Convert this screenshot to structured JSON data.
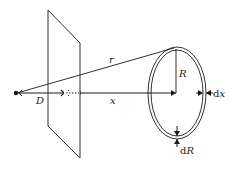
{
  "diagram": {
    "labels": {
      "D": "D",
      "x": "x",
      "r": "r",
      "R": "R",
      "dx_d": "d",
      "dx_var": "x",
      "dR_d": "d",
      "dR_var": "R"
    },
    "colors": {
      "stroke": "#1a1a1a",
      "background": "#ffffff"
    },
    "elements": [
      {
        "name": "point-source",
        "shape": "dot"
      },
      {
        "name": "plane",
        "shape": "parallelogram"
      },
      {
        "name": "axis-line",
        "shape": "arrow",
        "label": "x"
      },
      {
        "name": "distance-D",
        "shape": "dimension",
        "label": "D"
      },
      {
        "name": "slant-line",
        "shape": "line",
        "label": "r"
      },
      {
        "name": "ring",
        "shape": "double-ellipse",
        "label": "R"
      },
      {
        "name": "thickness-dx",
        "shape": "dimension",
        "label": "dx"
      },
      {
        "name": "thickness-dR",
        "shape": "dimension",
        "label": "dR"
      }
    ]
  }
}
